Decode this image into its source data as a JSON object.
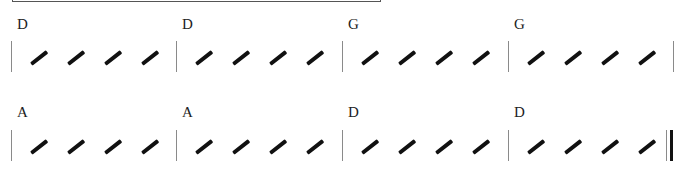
{
  "score": {
    "systems": [
      {
        "measures": [
          {
            "chord": "D",
            "beats": 4
          },
          {
            "chord": "D",
            "beats": 4
          },
          {
            "chord": "G",
            "beats": 4
          },
          {
            "chord": "G",
            "beats": 4
          }
        ],
        "end_barline": "single"
      },
      {
        "measures": [
          {
            "chord": "A",
            "beats": 4
          },
          {
            "chord": "A",
            "beats": 4
          },
          {
            "chord": "D",
            "beats": 4
          },
          {
            "chord": "D",
            "beats": 4
          }
        ],
        "end_barline": "final"
      }
    ]
  }
}
